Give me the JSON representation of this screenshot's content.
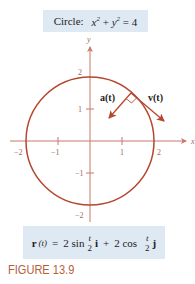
{
  "caption": {
    "label": "Circle:",
    "equation_x": "x",
    "equation_y": "y",
    "exp": "2",
    "plus": "+",
    "equals": "= 4"
  },
  "diagram": {
    "axis_x_label": "x",
    "axis_y_label": "y",
    "ticks_x": [
      "−2",
      "−1",
      "1",
      "2"
    ],
    "ticks_y": [
      "2",
      "1",
      "−1",
      "−2"
    ],
    "vector_a_label": "a(t)",
    "vector_v_label": "v(t)",
    "curve_color": "#b5472f",
    "axis_color": "#c9786a"
  },
  "formula": {
    "r": "r",
    "t_arg": "(t)",
    "eq": "=",
    "part1": "2 sin",
    "frac_num": "t",
    "frac_den": "2",
    "i": "i",
    "plus": "+",
    "part2": "2 cos",
    "j": "j"
  },
  "figure_label": "FIGURE 13.9"
}
